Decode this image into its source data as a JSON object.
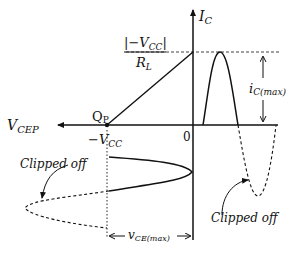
{
  "diagram": {
    "labels": {
      "y_axis": "I",
      "y_axis_sub": "C",
      "x_axis": "V",
      "x_axis_sub": "CEP",
      "origin": "0",
      "q_point": "Q",
      "q_point_sub": "P",
      "neg_vcc": "−V",
      "neg_vcc_sub": "CC",
      "intercept_num": "|−V",
      "intercept_num_sub": "CC",
      "intercept_num_end": "|",
      "intercept_den": "R",
      "intercept_den_sub": "L",
      "ic_max": "i",
      "ic_max_sub": "C(max)",
      "vce_max": "v",
      "vce_max_sub": "CE(max)",
      "clipped_left": "Clipped off",
      "clipped_right": "Clipped off"
    }
  }
}
